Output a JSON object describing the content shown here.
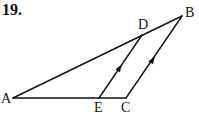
{
  "problem": {
    "number": "19."
  },
  "diagram": {
    "points": {
      "A": {
        "label": "A",
        "x": 13,
        "y": 98
      },
      "B": {
        "label": "B",
        "x": 182,
        "y": 16
      },
      "C": {
        "label": "C",
        "x": 126,
        "y": 98
      },
      "D": {
        "label": "D",
        "x": 142,
        "y": 35
      },
      "E": {
        "label": "E",
        "x": 99,
        "y": 98
      }
    },
    "segments": [
      "AB",
      "AC",
      "BC",
      "DE"
    ],
    "parallel_marks": [
      "DE",
      "BC"
    ],
    "stroke_color": "#111111"
  }
}
